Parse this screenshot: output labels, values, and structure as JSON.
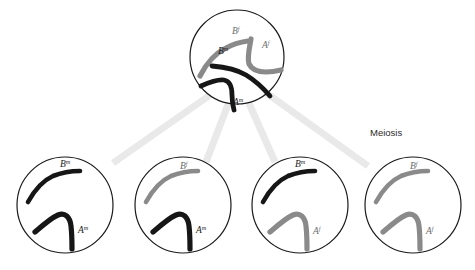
{
  "diagram": {
    "title_label": "Meiosis",
    "colors": {
      "maternal": "#161616",
      "paternal": "#8a8a8a",
      "connector": "#e9e9e9",
      "cell_outline": "#1a1a1a",
      "background": "#ffffff"
    },
    "parent_cell": {
      "name": "parent-cell",
      "cx": 237,
      "cy": 57,
      "r": 47,
      "chromosomes": [
        {
          "id": "parent-chromosome-Bf",
          "gene": "B",
          "superscript": "f",
          "origin": "paternal",
          "color": "#8a8a8a",
          "path": "M 200 76 C 206 64 214 54 226 48 C 233 44 241 42 248 41",
          "width": 5.2,
          "label_x": 232,
          "label_y": 34,
          "label_gray": true
        },
        {
          "id": "parent-chromosome-Af",
          "gene": "A",
          "superscript": "f",
          "origin": "paternal",
          "color": "#8a8a8a",
          "path": "M 251 39 C 249 50 247 58 249 64 C 252 70 258 72 266 72 C 272 72 277 71 281 70",
          "width": 5.2,
          "label_x": 262,
          "label_y": 48,
          "label_gray": true
        },
        {
          "id": "parent-chromosome-Bm",
          "gene": "B",
          "superscript": "m",
          "origin": "maternal",
          "color": "#161616",
          "path": "M 212 66 C 224 67 236 69 246 75 C 256 81 264 89 270 96",
          "width": 4.8,
          "label_x": 218,
          "label_y": 54,
          "label_gray": false
        },
        {
          "id": "parent-chromosome-Am",
          "gene": "A",
          "superscript": "m",
          "origin": "maternal",
          "color": "#161616",
          "path": "M 201 86 C 210 82 218 79 224 80 C 230 81 232 87 232 95 C 232 101 233 106 234 110",
          "width": 4.8,
          "label_x": 233,
          "label_y": 105,
          "label_gray": false
        }
      ]
    },
    "connectors": [
      {
        "id": "connector-to-cell-1",
        "x1": 213,
        "y1": 93,
        "x2": 113,
        "y2": 163
      },
      {
        "id": "connector-to-cell-2",
        "x1": 229,
        "y1": 102,
        "x2": 206,
        "y2": 162
      },
      {
        "id": "connector-to-cell-3",
        "x1": 248,
        "y1": 101,
        "x2": 275,
        "y2": 162
      },
      {
        "id": "connector-to-cell-4",
        "x1": 265,
        "y1": 92,
        "x2": 368,
        "y2": 166
      }
    ],
    "stage_label": {
      "text": "Meiosis",
      "x": 370,
      "y": 136
    },
    "daughter_cells": [
      {
        "name": "daughter-cell-1",
        "cx": 65,
        "cy": 205,
        "r": 48,
        "chromosomes": [
          {
            "id": "daughter-1-chromosome-B",
            "gene": "B",
            "superscript": "m",
            "origin": "maternal",
            "color": "#161616",
            "label_x": 60,
            "label_y": 167,
            "label_gray": false
          },
          {
            "id": "daughter-1-chromosome-A",
            "gene": "A",
            "superscript": "m",
            "origin": "maternal",
            "color": "#161616",
            "label_x": 78,
            "label_y": 233,
            "label_gray": false
          }
        ]
      },
      {
        "name": "daughter-cell-2",
        "cx": 183,
        "cy": 205,
        "r": 48,
        "chromosomes": [
          {
            "id": "daughter-2-chromosome-B",
            "gene": "B",
            "superscript": "f",
            "origin": "paternal",
            "color": "#8a8a8a",
            "label_x": 180,
            "label_y": 169,
            "label_gray": true
          },
          {
            "id": "daughter-2-chromosome-A",
            "gene": "A",
            "superscript": "m",
            "origin": "maternal",
            "color": "#161616",
            "label_x": 196,
            "label_y": 233,
            "label_gray": false
          }
        ]
      },
      {
        "name": "daughter-cell-3",
        "cx": 300,
        "cy": 205,
        "r": 48,
        "chromosomes": [
          {
            "id": "daughter-3-chromosome-B",
            "gene": "B",
            "superscript": "m",
            "origin": "maternal",
            "color": "#161616",
            "label_x": 295,
            "label_y": 167,
            "label_gray": false
          },
          {
            "id": "daughter-3-chromosome-A",
            "gene": "A",
            "superscript": "f",
            "origin": "paternal",
            "color": "#8a8a8a",
            "label_x": 313,
            "label_y": 234,
            "label_gray": true
          }
        ]
      },
      {
        "name": "daughter-cell-4",
        "cx": 413,
        "cy": 205,
        "r": 48,
        "chromosomes": [
          {
            "id": "daughter-4-chromosome-B",
            "gene": "B",
            "superscript": "f",
            "origin": "paternal",
            "color": "#8a8a8a",
            "label_x": 410,
            "label_y": 169,
            "label_gray": true
          },
          {
            "id": "daughter-4-chromosome-A",
            "gene": "A",
            "superscript": "f",
            "origin": "paternal",
            "color": "#8a8a8a",
            "label_x": 426,
            "label_y": 234,
            "label_gray": true
          }
        ]
      }
    ]
  }
}
